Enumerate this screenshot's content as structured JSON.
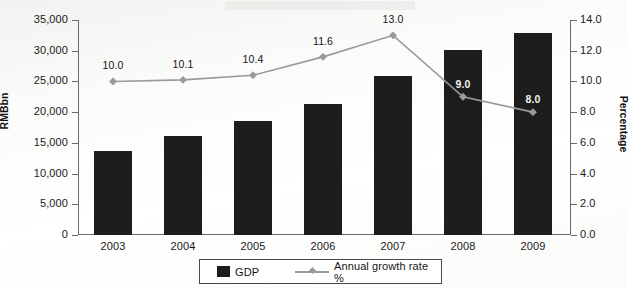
{
  "chart_data": {
    "type": "bar",
    "title": "",
    "categories": [
      "2003",
      "2004",
      "2005",
      "2006",
      "2007",
      "2008",
      "2009"
    ],
    "series": [
      {
        "name": "GDP",
        "kind": "bar",
        "axis": "left",
        "color": "#1d1d1d",
        "values": [
          13600,
          16100,
          18500,
          21400,
          25900,
          30200,
          32900
        ],
        "data_labels": []
      },
      {
        "name": "Annual growth rate %",
        "kind": "line",
        "axis": "right",
        "color": "#9a9a9a",
        "values": [
          10.0,
          10.1,
          10.4,
          11.6,
          13.0,
          9.0,
          8.0
        ],
        "data_labels": [
          "10.0",
          "10.1",
          "10.4",
          "11.6",
          "13.0",
          "9.0",
          "8.0"
        ],
        "label_inverted": [
          false,
          false,
          false,
          false,
          false,
          true,
          true
        ]
      }
    ],
    "xlabel": "",
    "ylabel": "RMBbn",
    "y2label": "Percentage",
    "ylim": [
      0,
      35000
    ],
    "y2lim": [
      0,
      14
    ],
    "yticks": [
      "0",
      "5,000",
      "10,000",
      "15,000",
      "20,000",
      "25,000",
      "30,000",
      "35,000"
    ],
    "ytick_values": [
      0,
      5000,
      10000,
      15000,
      20000,
      25000,
      30000,
      35000
    ],
    "y2ticks": [
      "0.0",
      "2.0",
      "4.0",
      "6.0",
      "8.0",
      "10.0",
      "12.0",
      "14.0"
    ],
    "y2tick_values": [
      0,
      2,
      4,
      6,
      8,
      10,
      12,
      14
    ],
    "grid": false,
    "legend_position": "bottom",
    "legend": [
      {
        "label": "GDP",
        "marker": "square-swatch",
        "color": "#1d1d1d"
      },
      {
        "label": "Annual growth rate %",
        "marker": "line-with-diamond",
        "color": "#9a9a9a"
      }
    ]
  }
}
